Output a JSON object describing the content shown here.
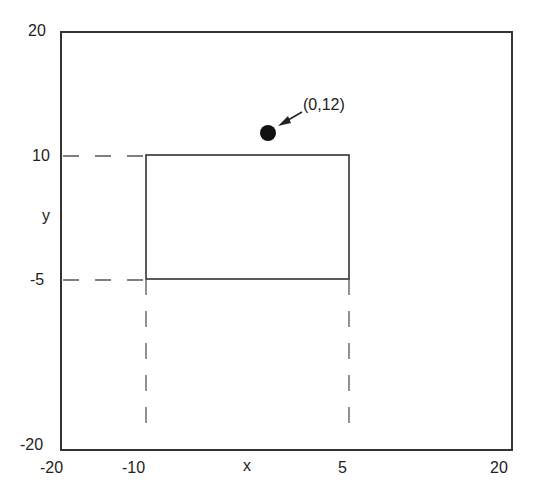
{
  "diagram": {
    "axes": {
      "x_label": "x",
      "y_label": "y",
      "x_ticks": [
        "-20",
        "-10",
        "5",
        "20"
      ],
      "y_ticks": [
        "20",
        "10",
        "-5",
        "-20"
      ],
      "xlim": [
        -20,
        20
      ],
      "ylim": [
        -20,
        20
      ]
    },
    "rectangle": {
      "x_min": -10,
      "x_max": 5,
      "y_min": -5,
      "y_max": 10
    },
    "point": {
      "label": "(0,12)",
      "x": 0,
      "y": 12
    },
    "colors": {
      "line": "#333333",
      "dash": "#555555",
      "point": "#111111"
    }
  }
}
